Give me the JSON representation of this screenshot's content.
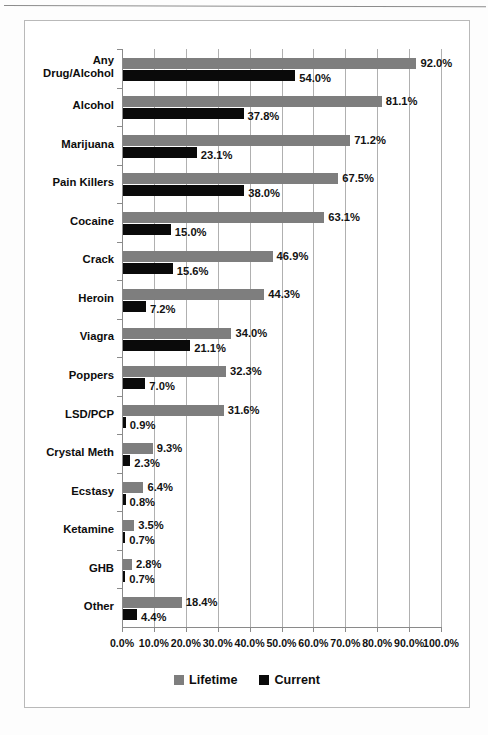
{
  "chart_data": {
    "type": "bar",
    "orientation": "horizontal",
    "title": "",
    "xlabel": "",
    "ylabel": "",
    "xlim": [
      0,
      100
    ],
    "grid": true,
    "legend_position": "bottom",
    "categories": [
      "Any\nDrug/Alcohol",
      "Alcohol",
      "Marijuana",
      "Pain Killers",
      "Cocaine",
      "Crack",
      "Heroin",
      "Viagra",
      "Poppers",
      "LSD/PCP",
      "Crystal Meth",
      "Ecstasy",
      "Ketamine",
      "GHB",
      "Other"
    ],
    "series": [
      {
        "name": "Lifetime",
        "color": "#7e7e7e",
        "values": [
          92.0,
          81.1,
          71.2,
          67.5,
          63.1,
          46.9,
          44.3,
          34.0,
          32.3,
          31.6,
          9.3,
          6.4,
          3.5,
          2.8,
          18.4
        ],
        "labels": [
          "92.0%",
          "81.1%",
          "71.2%",
          "67.5%",
          "63.1%",
          "46.9%",
          "44.3%",
          "34.0%",
          "32.3%",
          "31.6%",
          "9.3%",
          "6.4%",
          "3.5%",
          "2.8%",
          "18.4%"
        ]
      },
      {
        "name": "Current",
        "color": "#0a0a0a",
        "values": [
          54.0,
          37.8,
          23.1,
          38.0,
          15.0,
          15.6,
          7.2,
          21.1,
          7.0,
          0.9,
          2.3,
          0.8,
          0.7,
          0.7,
          4.4
        ],
        "labels": [
          "54.0%",
          "37.8%",
          "23.1%",
          "38.0%",
          "15.0%",
          "15.6%",
          "7.2%",
          "21.1%",
          "7.0%",
          "0.9%",
          "2.3%",
          "0.8%",
          "0.7%",
          "0.7%",
          "4.4%"
        ]
      }
    ],
    "xticks": [
      0,
      10,
      20,
      30,
      40,
      50,
      60,
      70,
      80,
      90,
      100
    ],
    "xticklabels": [
      "0.0%",
      "10.0%",
      "20.0%",
      "30.0%",
      "40.0%",
      "50.0%",
      "60.0%",
      "70.0%",
      "80.0%",
      "90.0%",
      "100.0%"
    ]
  },
  "legend": {
    "items": [
      {
        "label": "Lifetime",
        "color": "#7e7e7e"
      },
      {
        "label": "Current",
        "color": "#0a0a0a"
      }
    ]
  },
  "caption": {
    "text": ""
  }
}
